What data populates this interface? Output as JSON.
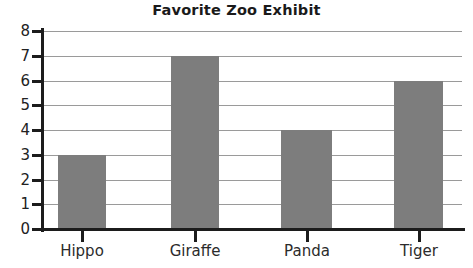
{
  "chart_data": {
    "type": "bar",
    "title": "Favorite Zoo Exhibit",
    "xlabel": "",
    "ylabel": "",
    "categories": [
      "Hippo",
      "Giraffe",
      "Panda",
      "Tiger"
    ],
    "values": [
      3,
      7,
      4,
      6
    ],
    "ylim": [
      0,
      8
    ],
    "yticks": [
      0,
      1,
      2,
      3,
      4,
      5,
      6,
      7,
      8
    ],
    "ytick_labels": [
      "0",
      "1",
      "2",
      "3",
      "4",
      "5",
      "6",
      "7",
      "8"
    ],
    "grid": true,
    "grid_axis": "y",
    "legend": false,
    "bar_color": "#7d7d7d",
    "axis_color": "#1c1c1c",
    "gridline_color": "#9a9a9a",
    "background_color": "#ffffff"
  }
}
